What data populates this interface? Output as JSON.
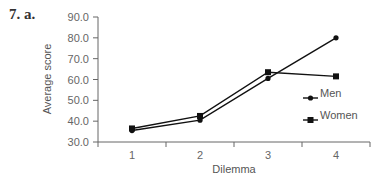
{
  "figure_label": "7. a.",
  "chart_data": {
    "type": "line",
    "title": "",
    "xlabel": "Dilemma",
    "ylabel": "Average score",
    "categories": [
      "1",
      "2",
      "3",
      "4"
    ],
    "x": [
      1,
      2,
      3,
      4
    ],
    "ylim": [
      30,
      90
    ],
    "yticks": [
      "30.0",
      "40.0",
      "50.0",
      "60.0",
      "70.0",
      "80.0",
      "90.0"
    ],
    "grid": false,
    "legend_position": "right, inside plot",
    "series": [
      {
        "name": "Men",
        "marker": "circle",
        "values": [
          35.5,
          40.5,
          60.5,
          80.0
        ]
      },
      {
        "name": "Women",
        "marker": "square",
        "values": [
          36.5,
          42.5,
          63.5,
          61.5
        ]
      }
    ]
  },
  "colors": {
    "line": "#111111",
    "axis": "#666666",
    "text": "#555555"
  }
}
